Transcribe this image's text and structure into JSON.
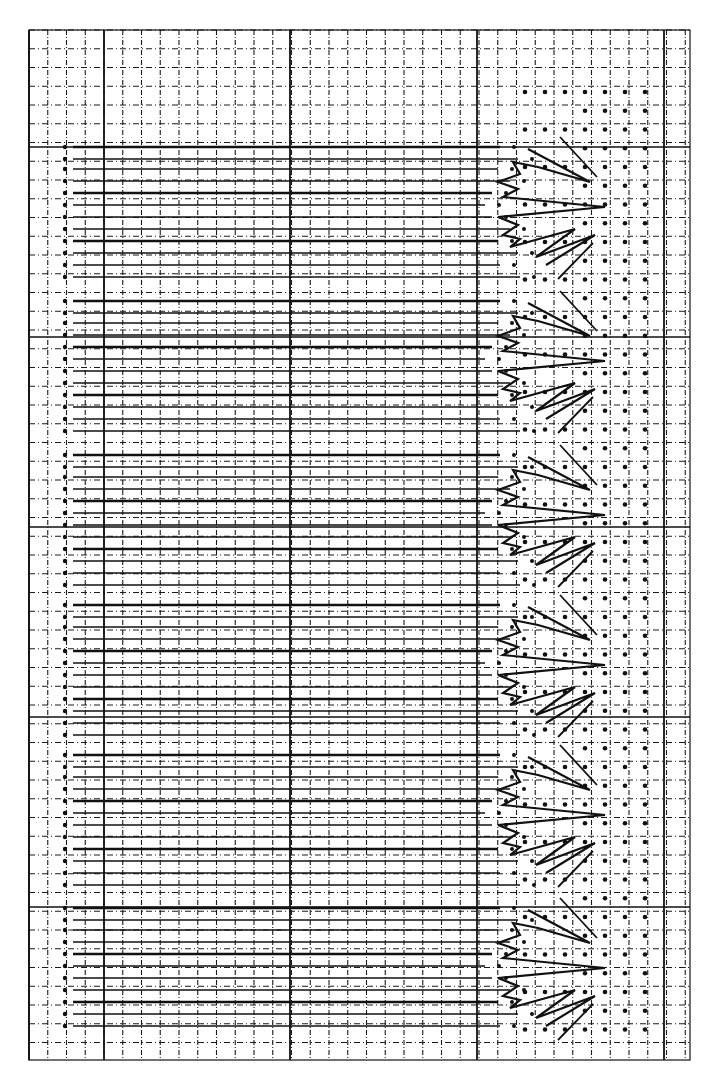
{
  "figure": {
    "colors": {
      "ink": "#111111",
      "paper": "#ffffff",
      "grid": "#1a1a1a"
    },
    "grid": {
      "x0": 29,
      "y0": 30,
      "x1": 690,
      "y1": 1060,
      "spacing": 18.75,
      "major_every": 5,
      "major_columns_x": [
        29,
        104,
        290,
        477,
        664
      ],
      "major_rows_y": [
        147,
        337,
        527,
        717,
        907
      ]
    },
    "left_dot_column_x": 65,
    "line_start_x": 73,
    "zigzag": {
      "period_px": 152,
      "peaks_y": [
        207,
        361,
        515,
        665,
        815,
        968
      ],
      "peak_x": 605,
      "trough_x": 498
    },
    "lattice_dot_columns_x": [
      525,
      545,
      565,
      585,
      605,
      625,
      645
    ],
    "text_labels": []
  }
}
